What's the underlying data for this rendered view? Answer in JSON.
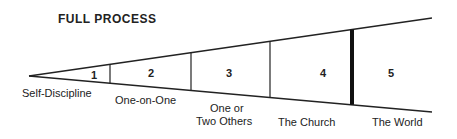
{
  "title": "FULL PROCESS",
  "segments": [
    {
      "number": "1",
      "label": "Self-Discipline"
    },
    {
      "number": "2",
      "label": "One-on-One"
    },
    {
      "number": "3",
      "label_line1": "One or",
      "label_line2": "Two Others"
    },
    {
      "number": "4",
      "label": "The Church"
    },
    {
      "number": "5",
      "label": "The World"
    }
  ]
}
